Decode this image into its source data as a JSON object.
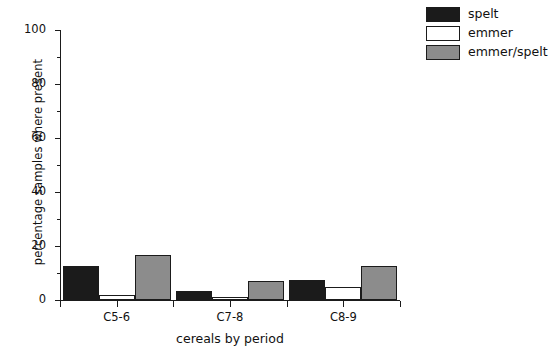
{
  "chart_data": {
    "type": "bar",
    "title": "",
    "xlabel": "cereals by period",
    "ylabel": "percentage samples where present",
    "categories": [
      "C5-6",
      "C7-8",
      "C8-9"
    ],
    "series": [
      {
        "name": "spelt",
        "color": "#1b1b1b",
        "values": [
          12.5,
          3.5,
          7.5
        ]
      },
      {
        "name": "emmer",
        "color": "#ffffff",
        "values": [
          2,
          1,
          5
        ]
      },
      {
        "name": "emmer/spelt",
        "color": "#8c8c8c",
        "values": [
          16.5,
          7,
          12.5
        ]
      }
    ],
    "ylim": [
      0,
      100
    ],
    "yticks": [
      0,
      20,
      40,
      60,
      80,
      100
    ],
    "yticks_minor": [
      10,
      30,
      50,
      70,
      90
    ],
    "grid": false,
    "legend_position": "top-right"
  },
  "axes": {
    "y_tick_labels": [
      "0",
      "20",
      "40",
      "60",
      "80",
      "100"
    ],
    "x_tick_labels": [
      "C5-6",
      "C7-8",
      "C8-9"
    ],
    "y_axis_title": "percentage samples where present",
    "x_axis_title": "cereals by period"
  },
  "legend": {
    "items": [
      {
        "label": "spelt",
        "color": "#1b1b1b"
      },
      {
        "label": "emmer",
        "color": "#ffffff"
      },
      {
        "label": "emmer/spelt",
        "color": "#8c8c8c"
      }
    ]
  }
}
